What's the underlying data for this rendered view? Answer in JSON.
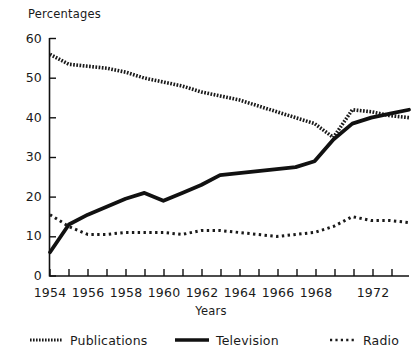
{
  "chart_data": {
    "type": "line",
    "title": "",
    "ylabel": "Percentages",
    "xlabel": "Years",
    "xlim": [
      1954,
      1973
    ],
    "ylim": [
      0,
      60
    ],
    "ytick_labels": [
      "0",
      "10",
      "20",
      "30",
      "40",
      "50",
      "60"
    ],
    "ytick_values": [
      0,
      10,
      20,
      30,
      40,
      50,
      60
    ],
    "xtick_labels": [
      "1954",
      "1956",
      "1958",
      "1960",
      "1962",
      "1964",
      "1966",
      "1968",
      "1972"
    ],
    "xtick_values": [
      1954,
      1956,
      1958,
      1960,
      1962,
      1964,
      1966,
      1968,
      1972
    ],
    "xminor_values": [
      1955,
      1957,
      1959,
      1961,
      1963,
      1965,
      1967,
      1969,
      1970,
      1971,
      1972,
      1973
    ],
    "grid": false,
    "legend_position": "bottom",
    "x": [
      1954,
      1955,
      1956,
      1957,
      1958,
      1959,
      1960,
      1961,
      1962,
      1963,
      1964,
      1965,
      1966,
      1967,
      1968,
      1969,
      1970,
      1971,
      1972,
      1973
    ],
    "series": [
      {
        "name": "Publications",
        "style": "chain",
        "color": "#1a1a1a",
        "values": [
          56.0,
          53.5,
          53.0,
          52.5,
          51.5,
          50.0,
          49.0,
          48.0,
          46.5,
          45.5,
          44.5,
          43.0,
          41.5,
          40.0,
          38.5,
          35.0,
          42.0,
          41.5,
          40.5,
          40.0
        ]
      },
      {
        "name": "Television",
        "style": "solid",
        "color": "#111111",
        "values": [
          6.0,
          13.0,
          15.5,
          17.5,
          19.5,
          21.0,
          19.0,
          21.0,
          23.0,
          25.5,
          26.0,
          26.5,
          27.0,
          27.5,
          29.0,
          34.5,
          38.5,
          40.0,
          41.0,
          42.0
        ]
      },
      {
        "name": "Radio",
        "style": "dotted",
        "color": "#1a1a1a",
        "values": [
          15.5,
          12.5,
          10.5,
          10.5,
          11.0,
          11.0,
          11.0,
          10.5,
          11.5,
          11.5,
          11.0,
          10.5,
          10.0,
          10.5,
          11.0,
          12.5,
          15.0,
          14.0,
          14.0,
          13.5
        ]
      }
    ]
  },
  "legend": {
    "items": [
      {
        "label": "Publications",
        "swatch": "chain-line-swatch"
      },
      {
        "label": "Television",
        "swatch": "solid-line-swatch"
      },
      {
        "label": "Radio",
        "swatch": "dotted-line-swatch"
      }
    ]
  }
}
